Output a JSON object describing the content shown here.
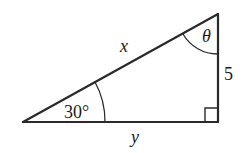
{
  "diagram": {
    "type": "right-triangle",
    "labels": {
      "hypotenuse": "x",
      "base": "y",
      "height": "5",
      "angle_bottom_left": "30°",
      "angle_top": "θ"
    },
    "right_angle_marker": true,
    "stroke_color": "#2a2a2a"
  }
}
